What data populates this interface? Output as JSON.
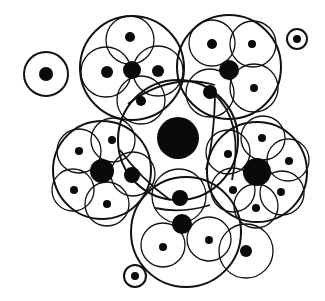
{
  "diagram": {
    "type": "nested-circle-clusters",
    "colors": {
      "background": "#ffffff",
      "stroke": "#111111",
      "fill": "#0a0a0a"
    },
    "central": {
      "dot": {
        "cx": 178,
        "cy": 138,
        "r": 21
      },
      "ring": {
        "cx": 178,
        "cy": 140,
        "r": 60,
        "w": 2
      }
    },
    "clusters": [
      {
        "id": "top-left",
        "outer": {
          "cx": 132,
          "cy": 68,
          "r": 52,
          "w": 2
        },
        "core": {
          "cx": 132,
          "cy": 70,
          "r": 9
        },
        "petals": [
          {
            "cx": 130,
            "cy": 40,
            "r": 24,
            "dot": {
              "cx": 130,
              "cy": 37,
              "r": 5
            }
          },
          {
            "cx": 106,
            "cy": 72,
            "r": 25,
            "dot": {
              "cx": 107,
              "cy": 72,
              "r": 6
            }
          },
          {
            "cx": 158,
            "cy": 71,
            "r": 25,
            "dot": {
              "cx": 158,
              "cy": 71,
              "r": 6
            }
          },
          {
            "cx": 141,
            "cy": 100,
            "r": 24,
            "dot": {
              "cx": 141,
              "cy": 101,
              "r": 5
            }
          }
        ]
      },
      {
        "id": "top-right",
        "outer": {
          "cx": 229,
          "cy": 67,
          "r": 52,
          "w": 2
        },
        "core": {
          "cx": 229,
          "cy": 70,
          "r": 10
        },
        "petals": [
          {
            "cx": 212,
            "cy": 43,
            "r": 23,
            "dot": {
              "cx": 212,
              "cy": 44,
              "r": 5
            }
          },
          {
            "cx": 253,
            "cy": 44,
            "r": 23,
            "dot": {
              "cx": 252,
              "cy": 44,
              "r": 4
            }
          },
          {
            "cx": 254,
            "cy": 88,
            "r": 24,
            "dot": {
              "cx": 254,
              "cy": 88,
              "r": 4
            }
          },
          {
            "cx": 210,
            "cy": 93,
            "r": 24,
            "dot": {
              "cx": 210,
              "cy": 92,
              "r": 7
            }
          }
        ]
      },
      {
        "id": "left",
        "outer": {
          "cx": 102,
          "cy": 170,
          "r": 49,
          "w": 2
        },
        "core": {
          "cx": 102,
          "cy": 171,
          "r": 12
        },
        "petals": [
          {
            "cx": 79,
            "cy": 151,
            "r": 22,
            "dot": {
              "cx": 79,
              "cy": 151,
              "r": 4
            }
          },
          {
            "cx": 113,
            "cy": 140,
            "r": 22,
            "dot": {
              "cx": 112,
              "cy": 140,
              "r": 4
            }
          },
          {
            "cx": 73,
            "cy": 190,
            "r": 21,
            "dot": {
              "cx": 74,
              "cy": 190,
              "r": 4
            }
          },
          {
            "cx": 107,
            "cy": 204,
            "r": 22,
            "dot": {
              "cx": 107,
              "cy": 204,
              "r": 4
            }
          },
          {
            "cx": 133,
            "cy": 174,
            "r": 22,
            "dot": {
              "cx": 132,
              "cy": 175,
              "r": 8
            }
          }
        ]
      },
      {
        "id": "right",
        "outer": {
          "cx": 257,
          "cy": 172,
          "r": 50,
          "w": 2
        },
        "core": {
          "cx": 257,
          "cy": 172,
          "r": 14
        },
        "petals": [
          {
            "cx": 263,
            "cy": 138,
            "r": 22,
            "dot": {
              "cx": 262,
              "cy": 138,
              "r": 4
            }
          },
          {
            "cx": 288,
            "cy": 160,
            "r": 21,
            "dot": {
              "cx": 289,
              "cy": 161,
              "r": 4
            }
          },
          {
            "cx": 282,
            "cy": 193,
            "r": 22,
            "dot": {
              "cx": 281,
              "cy": 192,
              "r": 4
            }
          },
          {
            "cx": 256,
            "cy": 206,
            "r": 22,
            "dot": {
              "cx": 256,
              "cy": 208,
              "r": 4
            }
          },
          {
            "cx": 233,
            "cy": 190,
            "r": 22,
            "dot": {
              "cx": 233,
              "cy": 190,
              "r": 4
            }
          },
          {
            "cx": 228,
            "cy": 152,
            "r": 22,
            "dot": {
              "cx": 228,
              "cy": 154,
              "r": 4
            }
          }
        ]
      },
      {
        "id": "bottom",
        "outer": {
          "cx": 186,
          "cy": 232,
          "r": 55,
          "w": 2
        },
        "core": {
          "cx": 182,
          "cy": 224,
          "r": 10
        },
        "petals": [
          {
            "cx": 179,
            "cy": 196,
            "r": 27,
            "dot": {
              "cx": 180,
              "cy": 198,
              "r": 8
            }
          },
          {
            "cx": 163,
            "cy": 245,
            "r": 22,
            "dot": {
              "cx": 163,
              "cy": 247,
              "r": 4
            }
          },
          {
            "cx": 209,
            "cy": 239,
            "r": 22,
            "dot": {
              "cx": 209,
              "cy": 240,
              "r": 4
            }
          },
          {
            "cx": 246,
            "cy": 251,
            "r": 27,
            "dot": {
              "cx": 246,
              "cy": 251,
              "r": 6
            }
          }
        ]
      }
    ],
    "singles": [
      {
        "id": "lone-left",
        "ring": {
          "cx": 46,
          "cy": 74,
          "r": 22
        },
        "dot": {
          "cx": 46,
          "cy": 74,
          "r": 7
        }
      },
      {
        "id": "lone-top-right",
        "ring": {
          "cx": 297,
          "cy": 39,
          "r": 10
        },
        "dot": {
          "cx": 297,
          "cy": 39,
          "r": 4
        }
      },
      {
        "id": "lone-bottom",
        "ring": {
          "cx": 135,
          "cy": 276,
          "r": 11
        },
        "dot": {
          "cx": 135,
          "cy": 276,
          "r": 4
        }
      }
    ],
    "arcs": [
      {
        "d": "M 128 104 Q 170 72 215 85"
      },
      {
        "d": "M 212 92 Q 245 120 232 180"
      },
      {
        "d": "M 120 150 Q 140 178 170 200"
      },
      {
        "d": "M 215 95 Q 214 140 206 170"
      },
      {
        "d": "M 155 208 Q 182 214 210 205"
      }
    ]
  }
}
